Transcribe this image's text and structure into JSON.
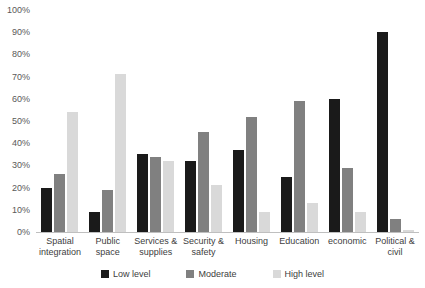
{
  "chart_data": {
    "type": "bar",
    "title": "",
    "subtitle": "",
    "xlabel": "",
    "ylabel": "",
    "ylim": [
      0,
      100
    ],
    "grid": false,
    "legend_position": "bottom",
    "categories": [
      "Spatial integration",
      "Public space",
      "Services & supplies",
      "Security & safety",
      "Housing",
      "Education",
      "economic",
      "Political & civil"
    ],
    "ytick_labels": [
      "100%",
      "90%",
      "80%",
      "70%",
      "60%",
      "50%",
      "40%",
      "30%",
      "20%",
      "10%",
      "0%"
    ],
    "ytick_values": [
      100,
      90,
      80,
      70,
      60,
      50,
      40,
      30,
      20,
      10,
      0
    ],
    "series": [
      {
        "name": "Low level",
        "color": "#1a1a1a",
        "values": [
          20,
          9,
          35,
          32,
          37,
          25,
          60,
          90
        ]
      },
      {
        "name": "Moderate",
        "color": "#808080",
        "values": [
          26,
          19,
          34,
          45,
          52,
          59,
          29,
          6
        ]
      },
      {
        "name": "High level",
        "color": "#d9d9d9",
        "values": [
          54,
          71,
          32,
          21,
          9,
          13,
          9,
          1
        ]
      }
    ]
  },
  "axis": {
    "y_ticks": [
      {
        "label": "100%",
        "value": 100
      },
      {
        "label": "90%",
        "value": 90
      },
      {
        "label": "80%",
        "value": 80
      },
      {
        "label": "70%",
        "value": 70
      },
      {
        "label": "60%",
        "value": 60
      },
      {
        "label": "50%",
        "value": 50
      },
      {
        "label": "40%",
        "value": 40
      },
      {
        "label": "30%",
        "value": 30
      },
      {
        "label": "20%",
        "value": 20
      },
      {
        "label": "10%",
        "value": 10
      },
      {
        "label": "0%",
        "value": 0
      }
    ]
  },
  "legend": {
    "items": [
      {
        "label": "Low level",
        "swatch": "low"
      },
      {
        "label": "Moderate",
        "swatch": "moderate"
      },
      {
        "label": "High level",
        "swatch": "high"
      }
    ]
  },
  "colors": {
    "low": "#1a1a1a",
    "moderate": "#808080",
    "high": "#d9d9d9",
    "axis_line": "#bfbfbf",
    "tick_text": "#595959",
    "label_text": "#404040",
    "background": "#ffffff"
  }
}
